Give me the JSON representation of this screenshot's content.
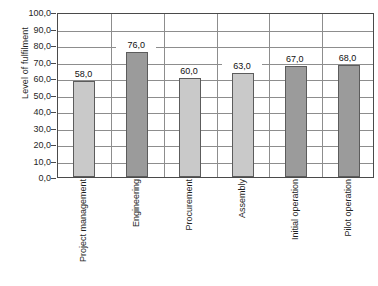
{
  "chart_data": {
    "type": "bar",
    "title": "",
    "subtitle": "",
    "xlabel": "",
    "ylabel": "Level of fulfilment",
    "categories": [
      "Project management",
      "Engineering",
      "Procurement",
      "Assembly",
      "Initial operation",
      "Pilot operation"
    ],
    "values": [
      58.0,
      76.0,
      60.0,
      63.0,
      67.0,
      68.0
    ],
    "value_labels": [
      "58,0",
      "76,0",
      "60,0",
      "63,0",
      "67,0",
      "68,0"
    ],
    "bar_colors": [
      "#c9c9c9",
      "#9b9b9b",
      "#c9c9c9",
      "#c9c9c9",
      "#9b9b9b",
      "#9b9b9b"
    ],
    "bar_border_color": "#5c5c5c",
    "ylim": [
      0,
      100
    ],
    "ytick_step": 10,
    "ytick_labels": [
      "100,0",
      "90,0",
      "80,0",
      "70,0",
      "60,0",
      "50,0",
      "40,0",
      "30,0",
      "20,0",
      "10,0",
      "0,0"
    ],
    "ytick_values": [
      100,
      90,
      80,
      70,
      60,
      50,
      40,
      30,
      20,
      10,
      0
    ],
    "grid": {
      "horizontal": true,
      "vertical": true,
      "color": "#8d8d8d"
    },
    "legend": {
      "visible": false,
      "position": "none",
      "entries": []
    },
    "plot_border_color": "#4a4a4a",
    "background_color": "#ffffff",
    "category_label_rotation": -90
  }
}
